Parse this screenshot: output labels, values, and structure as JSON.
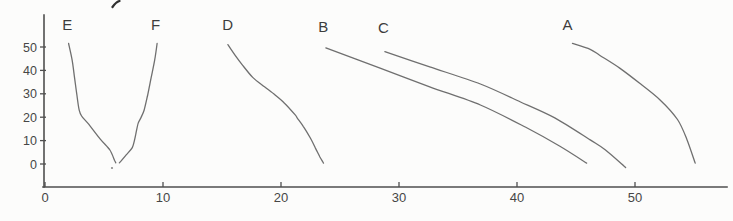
{
  "page": {
    "background": "#fcfcfb"
  },
  "chart_data": {
    "type": "line",
    "title": "",
    "xlabel": "",
    "ylabel": "",
    "x_ticks": [
      0,
      10,
      20,
      30,
      40,
      50
    ],
    "y_ticks": [
      0,
      10,
      20,
      30,
      40,
      50
    ],
    "xlim": [
      0,
      58
    ],
    "ylim": [
      0,
      55
    ],
    "grid": false,
    "legend": "inline-curve-labels",
    "colors": {
      "curve": "#636363",
      "axis": "#4f4f4f",
      "curve_label_text": "#3c3c3c",
      "tick_text": "#464646"
    },
    "series": [
      {
        "name": "E",
        "label": "E",
        "label_pos": [
          1.9,
          59.5
        ],
        "points": [
          [
            2.0,
            51.5
          ],
          [
            2.3,
            44.5
          ],
          [
            2.5,
            37.0
          ],
          [
            2.7,
            29.5
          ],
          [
            2.9,
            23.0
          ],
          [
            3.1,
            20.5
          ],
          [
            3.7,
            17.0
          ],
          [
            4.7,
            10.5
          ],
          [
            5.5,
            6.0
          ],
          [
            5.9,
            1.5
          ],
          [
            6.0,
            0.5
          ]
        ]
      },
      {
        "name": "F",
        "label": "F",
        "label_pos": [
          9.4,
          59.5
        ],
        "points": [
          [
            6.3,
            0.5
          ],
          [
            6.9,
            4.0
          ],
          [
            7.4,
            7.0
          ],
          [
            7.6,
            10.5
          ],
          [
            7.7,
            13.0
          ],
          [
            7.9,
            17.5
          ],
          [
            8.1,
            19.5
          ],
          [
            8.4,
            23.0
          ],
          [
            8.7,
            29.5
          ],
          [
            9.0,
            37.0
          ],
          [
            9.3,
            44.5
          ],
          [
            9.5,
            51.5
          ]
        ]
      },
      {
        "name": "D",
        "label": "D",
        "label_pos": [
          15.5,
          59.5
        ],
        "points": [
          [
            15.5,
            51.0
          ],
          [
            16.1,
            46.5
          ],
          [
            16.7,
            42.5
          ],
          [
            17.6,
            37.0
          ],
          [
            18.6,
            33.0
          ],
          [
            19.5,
            29.5
          ],
          [
            20.3,
            26.0
          ],
          [
            21.2,
            21.0
          ],
          [
            21.4,
            19.5
          ],
          [
            21.9,
            16.0
          ],
          [
            22.5,
            11.0
          ],
          [
            22.9,
            7.0
          ],
          [
            23.3,
            3.0
          ],
          [
            23.6,
            0.4
          ]
        ]
      },
      {
        "name": "B",
        "label": "B",
        "label_pos": [
          23.6,
          58.6
        ],
        "points": [
          [
            23.8,
            49.6
          ],
          [
            28.4,
            41.0
          ],
          [
            32.6,
            33.0
          ],
          [
            36.9,
            25.2
          ],
          [
            40.7,
            15.8
          ],
          [
            43.6,
            7.7
          ],
          [
            45.9,
            0.4
          ]
        ]
      },
      {
        "name": "C",
        "label": "C",
        "label_pos": [
          28.7,
          58.2
        ],
        "points": [
          [
            28.8,
            48.0
          ],
          [
            32.6,
            41.5
          ],
          [
            36.9,
            34.2
          ],
          [
            40.3,
            26.5
          ],
          [
            43.2,
            19.7
          ],
          [
            46.2,
            10.3
          ],
          [
            47.5,
            6.0
          ],
          [
            49.2,
            -1.5
          ]
        ]
      },
      {
        "name": "A",
        "label": "A",
        "label_pos": [
          44.3,
          59.5
        ],
        "points": [
          [
            44.7,
            51.5
          ],
          [
            46.2,
            49.0
          ],
          [
            47.0,
            46.5
          ],
          [
            48.7,
            41.0
          ],
          [
            50.4,
            34.5
          ],
          [
            52.1,
            27.5
          ],
          [
            53.6,
            19.0
          ],
          [
            54.4,
            10.5
          ],
          [
            55.1,
            0.4
          ]
        ]
      }
    ],
    "artifacts": [
      {
        "name": "cropped-glyph-top-edge",
        "type": "stroke",
        "px_from": [
          112.5,
          7
        ],
        "px_to": [
          119.5,
          1
        ]
      },
      {
        "name": "ink-speck",
        "type": "dot",
        "px": [
          112,
          168
        ]
      }
    ]
  }
}
